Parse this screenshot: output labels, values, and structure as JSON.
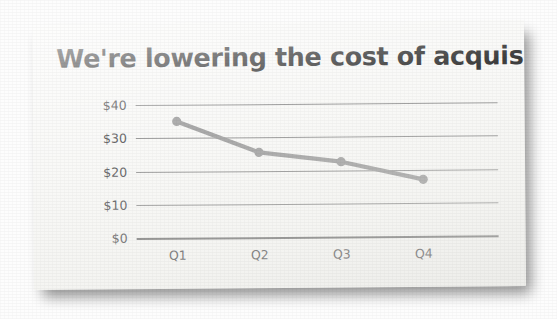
{
  "slide": {
    "title": "We're lowering the cost of acquisition",
    "background_color": "#f8f8f6",
    "title_color": "#1c1c1c"
  },
  "chart_data": {
    "type": "line",
    "title": "We're lowering the cost of acquisition",
    "categories": [
      "Q1",
      "Q2",
      "Q3",
      "Q4"
    ],
    "values": [
      35,
      25.5,
      22.5,
      17
    ],
    "xlabel": "",
    "ylabel": "",
    "ylim": [
      0,
      40
    ],
    "yticks": [
      0,
      10,
      20,
      30,
      40
    ],
    "ytick_labels": [
      "$0",
      "$10",
      "$20",
      "$30",
      "$40"
    ],
    "grid": true,
    "legend": false,
    "series_color": "#9a9a9a",
    "marker": "circle",
    "gridline_color": "#8d8d8d",
    "axis_color": "#6e6e6e",
    "tick_label_color": "#49494b"
  }
}
